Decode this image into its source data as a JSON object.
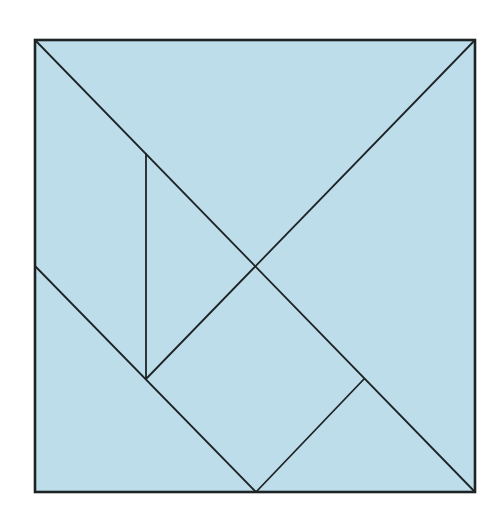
{
  "diagram": {
    "canvas": {
      "width": 503,
      "height": 524,
      "background": "#ffffff"
    },
    "style": {
      "fill": "#bcdde9",
      "stroke": "#1e2326",
      "outer_stroke_width": 2.6,
      "inner_stroke_width": 1.8
    },
    "square": {
      "x1": 35,
      "y1": 40,
      "x2": 475,
      "y2": 492
    },
    "pieces": [
      {
        "name": "large-triangle-top",
        "points": "35,40 475,40 256,266"
      },
      {
        "name": "large-triangle-right",
        "points": "475,40 475,492 256,266"
      },
      {
        "name": "medium-triangle-bottom-left",
        "points": "35,266 35,492 256,492"
      },
      {
        "name": "small-triangle-left",
        "points": "146,154 256,266 146,379"
      },
      {
        "name": "small-triangle-bottom",
        "points": "256,492 364,379 475,492"
      },
      {
        "name": "square-piece",
        "points": "146,379 256,266 364,379 256,492"
      },
      {
        "name": "parallelogram-left",
        "points": "35,40 146,154 146,379 35,266"
      }
    ],
    "lines": [
      {
        "name": "main-diagonal",
        "x1": 35,
        "y1": 40,
        "x2": 475,
        "y2": 492
      },
      {
        "name": "upper-anti-diagonal",
        "x1": 475,
        "y1": 40,
        "x2": 146,
        "y2": 379
      },
      {
        "name": "vertical-divider",
        "x1": 146,
        "y1": 154,
        "x2": 146,
        "y2": 379
      },
      {
        "name": "lower-left-diagonal",
        "x1": 35,
        "y1": 266,
        "x2": 256,
        "y2": 492
      },
      {
        "name": "square-lower-edge",
        "x1": 256,
        "y1": 492,
        "x2": 364,
        "y2": 379
      }
    ]
  }
}
